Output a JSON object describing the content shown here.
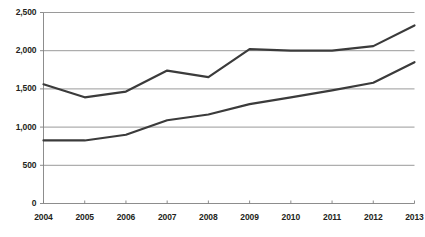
{
  "chart_data": {
    "type": "line",
    "title": "",
    "xlabel": "",
    "ylabel": "",
    "categories": [
      "2004",
      "2005",
      "2006",
      "2007",
      "2008",
      "2009",
      "2010",
      "2011",
      "2012",
      "2013"
    ],
    "x": [
      2004,
      2005,
      2006,
      2007,
      2008,
      2009,
      2010,
      2011,
      2012,
      2013
    ],
    "series": [
      {
        "name": "upper-series",
        "color": "#3b3b3b",
        "values": [
          1560,
          1390,
          1465,
          1740,
          1655,
          2020,
          2000,
          2000,
          2060,
          2330
        ]
      },
      {
        "name": "lower-series",
        "color": "#3b3b3b",
        "values": [
          825,
          825,
          900,
          1090,
          1165,
          1300,
          1390,
          1480,
          1580,
          1850
        ]
      }
    ],
    "ylim": [
      0,
      2500
    ],
    "ytick_values": [
      0,
      500,
      1000,
      1500,
      2000,
      2500
    ],
    "ytick_labels": [
      "0",
      "500",
      "1,000",
      "1,500",
      "2,000",
      "2,500"
    ],
    "xtick_labels": [
      "2004",
      "2005",
      "2006",
      "2007",
      "2008",
      "2009",
      "2010",
      "2011",
      "2012",
      "2013"
    ],
    "grid": true,
    "grid_axis": "y",
    "grid_color": "#808080",
    "axis_color": "#808080",
    "legend": false,
    "legend_position": "none",
    "background": "#ffffff"
  }
}
